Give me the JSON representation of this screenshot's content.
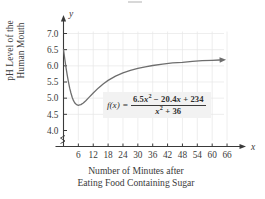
{
  "chart_data": {
    "type": "line",
    "title": "",
    "subtitle": "",
    "xlabel_lines": [
      "Number of Minutes after",
      "Eating Food Containing Sugar"
    ],
    "ylabel_lines": [
      "pH Level of the",
      "Human Mouth"
    ],
    "x_axis_symbol": "x",
    "y_axis_symbol": "y",
    "xticks": [
      6,
      12,
      18,
      24,
      30,
      36,
      42,
      48,
      54,
      60,
      66
    ],
    "xtick_labels": [
      "6",
      "12",
      "18",
      "24",
      "30",
      "36",
      "42",
      "48",
      "54",
      "60",
      "66"
    ],
    "yticks": [
      4.0,
      4.5,
      5.0,
      5.5,
      6.0,
      6.5,
      7.0
    ],
    "ytick_labels": [
      "4.0",
      "4.5",
      "5.0",
      "5.5",
      "6.0",
      "6.5",
      "7.0"
    ],
    "xlim": [
      0,
      68
    ],
    "ylim": [
      3.85,
      7.25
    ],
    "y_axis_break": true,
    "grid": true,
    "grid_color": "#e6e6e6",
    "curve_color": "#6e6e6e",
    "axis_color": "#3a3a3a",
    "formula_latex": "f(x) = (6.5x^2 - 20.4x + 234) / (x^2 + 36)",
    "series": [
      {
        "name": "f(x)",
        "arrow_end": true,
        "points": [
          {
            "x": 0.0,
            "y": 6.5
          },
          {
            "x": 0.5,
            "y": 6.22
          },
          {
            "x": 1.0,
            "y": 5.95
          },
          {
            "x": 1.5,
            "y": 5.71
          },
          {
            "x": 2.0,
            "y": 5.5
          },
          {
            "x": 2.5,
            "y": 5.31
          },
          {
            "x": 3.0,
            "y": 5.16
          },
          {
            "x": 3.5,
            "y": 5.03
          },
          {
            "x": 4.0,
            "y": 4.93
          },
          {
            "x": 4.5,
            "y": 4.86
          },
          {
            "x": 5.0,
            "y": 4.82
          },
          {
            "x": 5.5,
            "y": 4.79
          },
          {
            "x": 6.0,
            "y": 4.78
          },
          {
            "x": 6.5,
            "y": 4.79
          },
          {
            "x": 7.0,
            "y": 4.8
          },
          {
            "x": 8.0,
            "y": 4.85
          },
          {
            "x": 9.0,
            "y": 4.92
          },
          {
            "x": 10.0,
            "y": 5.0
          },
          {
            "x": 12.0,
            "y": 5.16
          },
          {
            "x": 14.0,
            "y": 5.31
          },
          {
            "x": 16.0,
            "y": 5.44
          },
          {
            "x": 18.0,
            "y": 5.55
          },
          {
            "x": 21.0,
            "y": 5.68
          },
          {
            "x": 24.0,
            "y": 5.78
          },
          {
            "x": 27.0,
            "y": 5.86
          },
          {
            "x": 30.0,
            "y": 5.92
          },
          {
            "x": 33.0,
            "y": 5.97
          },
          {
            "x": 36.0,
            "y": 6.01
          },
          {
            "x": 40.0,
            "y": 6.05
          },
          {
            "x": 44.0,
            "y": 6.09
          },
          {
            "x": 48.0,
            "y": 6.11
          },
          {
            "x": 52.0,
            "y": 6.14
          },
          {
            "x": 56.0,
            "y": 6.16
          },
          {
            "x": 60.0,
            "y": 6.17
          },
          {
            "x": 63.0,
            "y": 6.18
          }
        ]
      }
    ],
    "annotations": [
      {
        "name": "formula",
        "fx_label": "f(x)",
        "equals": "=",
        "numerator_parts": [
          "6.5",
          "x",
          "2",
          " − 20.4",
          "x",
          " + 234"
        ],
        "denominator_parts": [
          "x",
          "2",
          " + 36"
        ],
        "numerator_plain": "6.5x² − 20.4x + 234",
        "denominator_plain": "x² + 36"
      }
    ]
  }
}
